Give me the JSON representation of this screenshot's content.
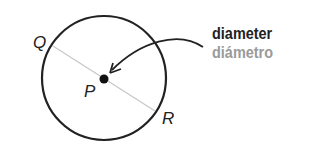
{
  "diagram": {
    "points": {
      "Q": "Q",
      "P": "P",
      "R": "R"
    },
    "term_english": "diameter",
    "term_spanish": "diámetro",
    "colors": {
      "stroke": "#222222",
      "diameter_line": "#c8c8c8",
      "spanish_text": "#9a9a9a"
    }
  }
}
